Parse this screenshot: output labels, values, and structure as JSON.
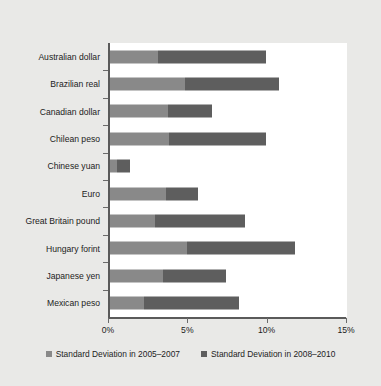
{
  "chart_data": {
    "type": "bar",
    "orientation": "horizontal",
    "stacked": true,
    "title": "",
    "xlabel": "",
    "ylabel": "",
    "xlim": [
      0,
      15
    ],
    "xticks": [
      0,
      5,
      10,
      15
    ],
    "xtick_labels": [
      "0%",
      "5%",
      "10%",
      "15%"
    ],
    "grid": false,
    "legend_position": "bottom",
    "categories": [
      "Australian dollar",
      "Brazilian real",
      "Canadian dollar",
      "Chilean peso",
      "Chinese yuan",
      "Euro",
      "Great Britain pound",
      "Hungary forint",
      "Japanese yen",
      "Mexican peso"
    ],
    "series": [
      {
        "name": "Standard Deviation in 2005–2007",
        "color": "#898989",
        "values": [
          3.1,
          4.8,
          3.7,
          3.8,
          0.5,
          3.6,
          2.9,
          4.9,
          3.4,
          2.2
        ]
      },
      {
        "name": "Standard Deviation in 2008–2010",
        "color": "#5e5e5e",
        "values": [
          6.8,
          5.9,
          2.8,
          6.1,
          0.8,
          2.0,
          5.7,
          6.8,
          4.0,
          6.0
        ]
      }
    ],
    "totals": [
      9.9,
      10.7,
      6.5,
      9.9,
      1.3,
      5.6,
      8.6,
      11.7,
      7.4,
      8.2
    ]
  },
  "legend": {
    "items": [
      {
        "label": "Standard Deviation in 2005–2007",
        "color": "#898989"
      },
      {
        "label": "Standard Deviation in 2008–2010",
        "color": "#5e5e5e"
      }
    ]
  }
}
